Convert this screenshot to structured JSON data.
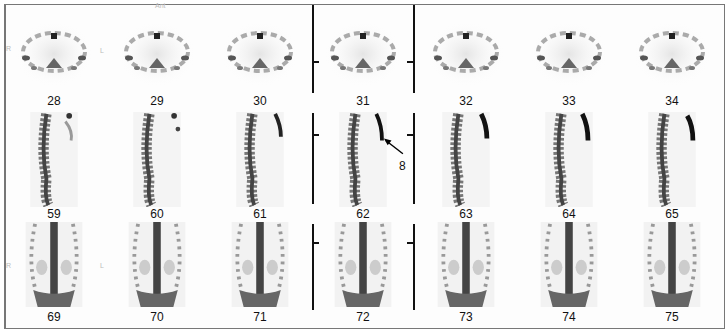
{
  "figure": {
    "rows": [
      {
        "view": "transverse",
        "slices": [
          "28",
          "29",
          "30",
          "31",
          "32",
          "33",
          "34"
        ]
      },
      {
        "view": "sagittal",
        "slices": [
          "59",
          "60",
          "61",
          "62",
          "63",
          "64",
          "65"
        ]
      },
      {
        "view": "coronal",
        "slices": [
          "69",
          "70",
          "71",
          "72",
          "73",
          "74",
          "75"
        ]
      }
    ],
    "orientation": {
      "top": "Ant",
      "right_side": "R",
      "left_side": "L"
    },
    "annotation": {
      "label": "8",
      "target_slice": "62"
    },
    "colors": {
      "background": "#ffffff",
      "uptake": "#1a1a1a",
      "frame": "#777777"
    }
  }
}
